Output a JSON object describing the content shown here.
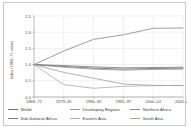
{
  "figure": {
    "background": "#ffffff",
    "border_color": "#c9c9c9"
  },
  "chart_data": {
    "type": "line",
    "title": "",
    "xlabel": "",
    "ylabel": "Index (1969–71 value)",
    "x": [
      "1969–71",
      "1979–81",
      "1990–92",
      "1995–97",
      "2000–02",
      "2005–07"
    ],
    "ylim": [
      0.0,
      2.5
    ],
    "yticks": [
      "0.0",
      "0.5",
      "1.0",
      "1.5",
      "2.0",
      "2.5"
    ],
    "ytick_values": [
      0.0,
      0.5,
      1.0,
      1.5,
      2.0,
      2.5
    ],
    "grid": true,
    "legend_position": "bottom",
    "series": [
      {
        "name": "World",
        "color": "#6f6f6f",
        "values": [
          1.0,
          0.94,
          0.89,
          0.86,
          0.88,
          0.89
        ]
      },
      {
        "name": "Developing Regions",
        "color": "#9a9a9a",
        "values": [
          1.0,
          0.92,
          0.86,
          0.83,
          0.85,
          0.86
        ]
      },
      {
        "name": "Northern Africa",
        "color": "#8d8d8d",
        "values": [
          1.0,
          1.42,
          1.78,
          1.92,
          2.12,
          2.13
        ]
      },
      {
        "name": "Sub-Saharan Africa",
        "color": "#7c7c7c",
        "values": [
          1.0,
          0.97,
          0.93,
          0.9,
          0.91,
          0.92
        ]
      },
      {
        "name": "Eastern Asia",
        "color": "#b0b0b0",
        "values": [
          1.0,
          0.38,
          0.27,
          0.33,
          0.35,
          0.36
        ]
      },
      {
        "name": "South Asia",
        "color": "#a3a3a3",
        "values": [
          1.0,
          0.76,
          0.58,
          0.4,
          0.36,
          0.35
        ]
      }
    ]
  },
  "legend": {
    "rows": [
      [
        {
          "label": "World",
          "color": "#6f6f6f"
        },
        {
          "label": "Developing Regions",
          "color": "#9a9a9a"
        },
        {
          "label": "Northern Africa",
          "color": "#8d8d8d"
        }
      ],
      [
        {
          "label": "Sub-Saharan Africa",
          "color": "#7c7c7c"
        },
        {
          "label": "Eastern Asia",
          "color": "#b0b0b0"
        },
        {
          "label": "South Asia",
          "color": "#a3a3a3"
        }
      ]
    ]
  }
}
